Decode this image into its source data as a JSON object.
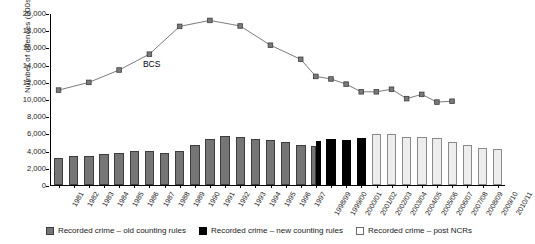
{
  "chart_data": {
    "type": "bar",
    "title": "",
    "xlabel": "",
    "ylabel": "Number of offences (000s)",
    "ylim": [
      0,
      20000
    ],
    "yticks": [
      0,
      2000,
      4000,
      6000,
      8000,
      10000,
      12000,
      14000,
      16000,
      18000,
      20000
    ],
    "ytick_labels": [
      "0",
      "2,000",
      "4,000",
      "6,000",
      "8,000",
      "10,000",
      "12,000",
      "14,000",
      "16,000",
      "18,000",
      "20,000"
    ],
    "grid": false,
    "legend_position": "bottom",
    "annotations": [
      {
        "text": "BCS",
        "x": "1989",
        "y": 14200
      }
    ],
    "categories": [
      "1981",
      "1982",
      "1983",
      "1984",
      "1985",
      "1986",
      "1987",
      "1988",
      "1989",
      "1990",
      "1991",
      "1992",
      "1993",
      "1994",
      "1995",
      "1996",
      "1997",
      "1998/99",
      "1999/00",
      "2000/01",
      "2001/02",
      "2002/03",
      "2003/04",
      "2004/05",
      "2005/06",
      "2006/07",
      "2007/08",
      "2008/09",
      "2009/10",
      "2010/11"
    ],
    "series": [
      {
        "name": "Recorded crime – old counting rules",
        "type": "bar",
        "color": "#757575",
        "values": [
          3100,
          3400,
          3400,
          3600,
          3700,
          3900,
          4000,
          3700,
          4000,
          4600,
          5400,
          5700,
          5600,
          5400,
          5200,
          5000,
          4600,
          4500,
          null,
          null,
          null,
          null,
          null,
          null,
          null,
          null,
          null,
          null,
          null,
          null
        ]
      },
      {
        "name": "Recorded crime – new counting rules",
        "type": "bar",
        "color": "#000000",
        "values": [
          null,
          null,
          null,
          null,
          null,
          null,
          null,
          null,
          null,
          null,
          null,
          null,
          null,
          null,
          null,
          null,
          null,
          5100,
          5300,
          5200,
          5500,
          null,
          null,
          null,
          null,
          null,
          null,
          null,
          null,
          null
        ]
      },
      {
        "name": "Recorded crime – post NCRs",
        "type": "bar",
        "color": "#ededed",
        "values": [
          null,
          null,
          null,
          null,
          null,
          null,
          null,
          null,
          null,
          null,
          null,
          null,
          null,
          null,
          null,
          null,
          null,
          null,
          null,
          null,
          null,
          5950,
          5950,
          5640,
          5560,
          5430,
          5000,
          4700,
          4300,
          4150
        ]
      },
      {
        "name": "BCS",
        "type": "line",
        "color": "#6b6b6b",
        "values": [
          11100,
          null,
          12000,
          null,
          13450,
          null,
          15300,
          null,
          18550,
          null,
          19250,
          null,
          18600,
          null,
          16350,
          null,
          14700,
          12700,
          12400,
          11800,
          10900,
          10900,
          11200,
          10100,
          10600,
          9700,
          9800,
          null,
          null,
          null
        ]
      }
    ]
  },
  "legend": {
    "items": [
      {
        "label": "Recorded crime – old counting rules",
        "style": "old"
      },
      {
        "label": "Recorded crime – new counting rules",
        "style": "new"
      },
      {
        "label": "Recorded crime – post NCRs",
        "style": "post"
      }
    ]
  }
}
